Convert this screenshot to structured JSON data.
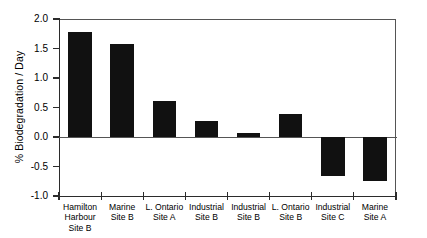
{
  "chart_data": {
    "type": "bar",
    "title": "",
    "xlabel": "",
    "ylabel": "% Biodegradation / Day",
    "ylim": [
      -1.0,
      2.0
    ],
    "yticks": [
      "2.0",
      "1.5",
      "1.0",
      "0.5",
      "0.0",
      "-0.5",
      "-1.0"
    ],
    "ytick_values": [
      2.0,
      1.5,
      1.0,
      0.5,
      0.0,
      -0.5,
      -1.0
    ],
    "grid": false,
    "legend": "none",
    "bar_color": "#111111",
    "background_color": "#ffffff",
    "axis_color": "#2b2b2b",
    "categories": [
      "Hamilton Harbour Site B",
      "Marine Site B",
      "L. Ontario Site A",
      "Industrial Site B",
      "Industrial Site B",
      "L. Ontario Site B",
      "Industrial Site C",
      "Marine Site A"
    ],
    "category_lines": [
      [
        "Hamilton",
        "Harbour",
        "Site B"
      ],
      [
        "Marine",
        "Site B"
      ],
      [
        "L. Ontario",
        "Site A"
      ],
      [
        "Industrial",
        "Site B"
      ],
      [
        "Industrial",
        "Site B"
      ],
      [
        "L. Ontario",
        "Site B"
      ],
      [
        "Industrial",
        "Site C"
      ],
      [
        "Marine",
        "Site A"
      ]
    ],
    "values": [
      1.78,
      1.58,
      0.61,
      0.27,
      0.07,
      0.39,
      -0.66,
      -0.75
    ]
  }
}
